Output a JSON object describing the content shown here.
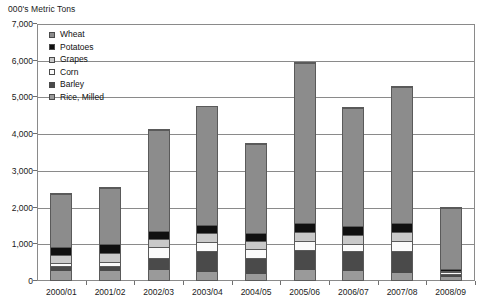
{
  "chart_data": {
    "type": "bar",
    "subtype": "stacked-column",
    "title": "",
    "ylabel": "000's Metric Tons",
    "xlabel": "",
    "ylim": [
      0,
      7000
    ],
    "ytick_values": [
      0,
      1000,
      2000,
      3000,
      4000,
      5000,
      6000,
      7000
    ],
    "ytick_labels": [
      "0",
      "1,000",
      "2,000",
      "3,000",
      "4,000",
      "5,000",
      "6,000",
      "7,000"
    ],
    "grid": true,
    "legend_position": "top-left-inside",
    "categories": [
      "2000/01",
      "2001/02",
      "2002/03",
      "2003/04",
      "2004/05",
      "2005/06",
      "2006/07",
      "2007/08",
      "2008/09"
    ],
    "stack_order_bottom_to_top": [
      "Rice, Milled",
      "Barley",
      "Corn",
      "Grapes",
      "Potatoes",
      "Wheat"
    ],
    "series": [
      {
        "name": "Wheat",
        "color": "#8c8c8c",
        "values": [
          1470,
          1560,
          2800,
          3260,
          2460,
          4380,
          3260,
          3760,
          1710
        ]
      },
      {
        "name": "Potatoes",
        "color": "#101010",
        "values": [
          230,
          250,
          210,
          230,
          200,
          250,
          240,
          250,
          40
        ]
      },
      {
        "name": "Grapes",
        "color": "#c9c9c9",
        "values": [
          240,
          250,
          240,
          250,
          230,
          250,
          240,
          250,
          40
        ]
      },
      {
        "name": "Corn",
        "color": "#fbfbfb",
        "values": [
          80,
          90,
          280,
          250,
          240,
          250,
          190,
          250,
          60
        ]
      },
      {
        "name": "Barley",
        "color": "#4a4a4a",
        "values": [
          130,
          160,
          340,
          560,
          460,
          560,
          570,
          610,
          80
        ]
      },
      {
        "name": "Rice, Milled",
        "color": "#9a9a9a",
        "values": [
          250,
          240,
          280,
          230,
          160,
          270,
          240,
          200,
          80
        ]
      }
    ],
    "totals": [
      2400,
      2550,
      4150,
      4780,
      3750,
      5960,
      4740,
      5320,
      2010
    ],
    "legend_entries": [
      {
        "label": "Wheat",
        "color": "#8c8c8c"
      },
      {
        "label": "Potatoes",
        "color": "#101010"
      },
      {
        "label": "Grapes",
        "color": "#c9c9c9"
      },
      {
        "label": "Corn",
        "color": "#fbfbfb"
      },
      {
        "label": "Barley",
        "color": "#4a4a4a"
      },
      {
        "label": "Rice, Milled",
        "color": "#9a9a9a"
      }
    ],
    "colors": {
      "frame": "#8a8a8a",
      "gridline": "#8a8a8a",
      "bar_outline": "#5a5a5a",
      "text": "#111111",
      "background": "#ffffff"
    }
  }
}
